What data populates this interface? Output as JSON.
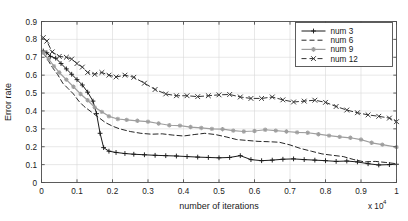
{
  "chart_data": {
    "type": "line",
    "title": "",
    "xlabel": "number of iterations",
    "ylabel": "Error rate",
    "x_multiplier": "x 10",
    "x_multiplier_exp": "4",
    "xlim": [
      0,
      1
    ],
    "ylim": [
      0,
      0.9
    ],
    "xticks": [
      "0",
      "0.1",
      "0.2",
      "0.3",
      "0.4",
      "0.5",
      "0.6",
      "0.7",
      "0.8",
      "0.9",
      "1"
    ],
    "xtick_values": [
      0,
      0.1,
      0.2,
      0.3,
      0.4,
      0.5,
      0.6,
      0.7,
      0.8,
      0.9,
      1
    ],
    "yticks": [
      "0",
      "0.1",
      "0.2",
      "0.3",
      "0.4",
      "0.5",
      "0.6",
      "0.7",
      "0.8",
      "0.9"
    ],
    "ytick_values": [
      0,
      0.1,
      0.2,
      0.3,
      0.4,
      0.5,
      0.6,
      0.7,
      0.8,
      0.9
    ],
    "grid": true,
    "legend_position": "top-right",
    "series": [
      {
        "name": "num  3",
        "color": "#1a1a1a",
        "dash": "none",
        "marker": "plus",
        "x": [
          0.005,
          0.015,
          0.025,
          0.04,
          0.055,
          0.07,
          0.085,
          0.1,
          0.115,
          0.13,
          0.145,
          0.155,
          0.165,
          0.175,
          0.19,
          0.21,
          0.235,
          0.26,
          0.29,
          0.32,
          0.35,
          0.38,
          0.41,
          0.44,
          0.47,
          0.5,
          0.53,
          0.56,
          0.59,
          0.62,
          0.65,
          0.68,
          0.71,
          0.74,
          0.77,
          0.8,
          0.83,
          0.86,
          0.89,
          0.92,
          0.95,
          0.98,
          1.0
        ],
        "y": [
          0.735,
          0.725,
          0.705,
          0.695,
          0.665,
          0.635,
          0.605,
          0.575,
          0.545,
          0.505,
          0.455,
          0.385,
          0.275,
          0.195,
          0.175,
          0.168,
          0.162,
          0.158,
          0.155,
          0.152,
          0.15,
          0.148,
          0.145,
          0.142,
          0.14,
          0.138,
          0.14,
          0.15,
          0.128,
          0.122,
          0.125,
          0.13,
          0.132,
          0.128,
          0.125,
          0.122,
          0.118,
          0.12,
          0.115,
          0.105,
          0.098,
          0.1,
          0.102
        ]
      },
      {
        "name": "num  6",
        "color": "#262626",
        "dash": "dashed",
        "marker": "none",
        "x": [
          0.005,
          0.015,
          0.03,
          0.045,
          0.06,
          0.075,
          0.09,
          0.105,
          0.12,
          0.14,
          0.16,
          0.18,
          0.2,
          0.22,
          0.25,
          0.28,
          0.31,
          0.34,
          0.37,
          0.4,
          0.43,
          0.46,
          0.49,
          0.52,
          0.55,
          0.58,
          0.61,
          0.64,
          0.67,
          0.7,
          0.73,
          0.76,
          0.79,
          0.82,
          0.85,
          0.88,
          0.91,
          0.94,
          0.97,
          1.0
        ],
        "y": [
          0.725,
          0.695,
          0.645,
          0.605,
          0.555,
          0.525,
          0.495,
          0.455,
          0.425,
          0.395,
          0.365,
          0.335,
          0.315,
          0.3,
          0.285,
          0.275,
          0.27,
          0.272,
          0.265,
          0.26,
          0.268,
          0.275,
          0.268,
          0.255,
          0.24,
          0.235,
          0.23,
          0.228,
          0.225,
          0.21,
          0.19,
          0.175,
          0.16,
          0.152,
          0.145,
          0.128,
          0.115,
          0.118,
          0.112,
          0.105
        ]
      },
      {
        "name": "num  9",
        "color": "#9e9e9e",
        "dash": "none",
        "marker": "star",
        "x": [
          0.005,
          0.02,
          0.035,
          0.05,
          0.07,
          0.09,
          0.11,
          0.13,
          0.15,
          0.17,
          0.19,
          0.215,
          0.24,
          0.27,
          0.3,
          0.33,
          0.36,
          0.39,
          0.42,
          0.45,
          0.48,
          0.51,
          0.54,
          0.57,
          0.6,
          0.63,
          0.66,
          0.69,
          0.72,
          0.75,
          0.78,
          0.81,
          0.84,
          0.87,
          0.9,
          0.93,
          0.96,
          1.0
        ],
        "y": [
          0.725,
          0.69,
          0.65,
          0.615,
          0.575,
          0.535,
          0.495,
          0.46,
          0.42,
          0.395,
          0.37,
          0.355,
          0.35,
          0.345,
          0.34,
          0.33,
          0.32,
          0.318,
          0.31,
          0.305,
          0.3,
          0.298,
          0.29,
          0.285,
          0.288,
          0.295,
          0.29,
          0.285,
          0.28,
          0.278,
          0.27,
          0.262,
          0.255,
          0.25,
          0.24,
          0.222,
          0.212,
          0.198
        ]
      },
      {
        "name": "num 12",
        "color": "#333333",
        "dash": "dashed",
        "marker": "x",
        "x": [
          0.005,
          0.015,
          0.03,
          0.05,
          0.07,
          0.085,
          0.1,
          0.115,
          0.13,
          0.15,
          0.17,
          0.19,
          0.21,
          0.235,
          0.26,
          0.29,
          0.32,
          0.35,
          0.38,
          0.41,
          0.44,
          0.47,
          0.5,
          0.53,
          0.56,
          0.59,
          0.62,
          0.65,
          0.68,
          0.71,
          0.74,
          0.77,
          0.8,
          0.83,
          0.86,
          0.89,
          0.92,
          0.95,
          0.98,
          1.0
        ],
        "y": [
          0.81,
          0.79,
          0.73,
          0.705,
          0.7,
          0.69,
          0.665,
          0.645,
          0.615,
          0.605,
          0.615,
          0.6,
          0.59,
          0.6,
          0.588,
          0.555,
          0.52,
          0.495,
          0.485,
          0.485,
          0.48,
          0.485,
          0.49,
          0.492,
          0.478,
          0.47,
          0.47,
          0.478,
          0.462,
          0.45,
          0.455,
          0.46,
          0.448,
          0.425,
          0.405,
          0.39,
          0.378,
          0.37,
          0.36,
          0.34
        ]
      }
    ],
    "legend_entries": [
      {
        "label": "num  3",
        "color": "#1a1a1a",
        "dash": "none",
        "marker": "plus"
      },
      {
        "label": "num  6",
        "color": "#262626",
        "dash": "dashed",
        "marker": "dash"
      },
      {
        "label": "num  9",
        "color": "#9e9e9e",
        "dash": "none",
        "marker": "star"
      },
      {
        "label": "num 12",
        "color": "#333333",
        "dash": "dashed",
        "marker": "x"
      }
    ]
  },
  "colors": {
    "background": "#ffffff",
    "axis": "#4d4d4d",
    "grid": "#d9d9d9",
    "text": "#1a1a1a"
  }
}
